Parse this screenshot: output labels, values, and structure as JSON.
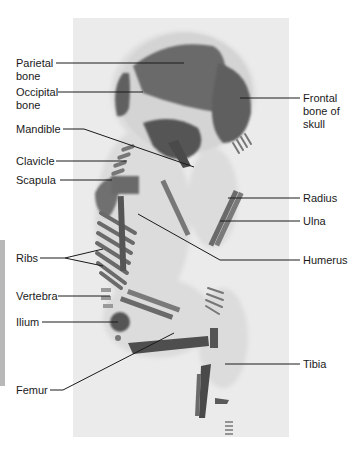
{
  "figure": {
    "labels_left": [
      {
        "id": "parietal",
        "text": "Parietal\nbone"
      },
      {
        "id": "occipital",
        "text": "Occipital\nbone"
      },
      {
        "id": "mandible",
        "text": "Mandible"
      },
      {
        "id": "clavicle",
        "text": "Clavicle"
      },
      {
        "id": "scapula",
        "text": "Scapula"
      },
      {
        "id": "ribs",
        "text": "Ribs"
      },
      {
        "id": "vertebra",
        "text": "Vertebra"
      },
      {
        "id": "ilium",
        "text": "Ilium"
      },
      {
        "id": "femur",
        "text": "Femur"
      }
    ],
    "labels_right": [
      {
        "id": "frontal",
        "text": "Frontal\nbone of\nskull"
      },
      {
        "id": "radius",
        "text": "Radius"
      },
      {
        "id": "ulna",
        "text": "Ulna"
      },
      {
        "id": "humerus",
        "text": "Humerus"
      },
      {
        "id": "tibia",
        "text": "Tibia"
      }
    ],
    "colors": {
      "photo_background": "#ebebeb",
      "body_halo": "#d9d9d9",
      "bone_dark": "#5a5a5a",
      "bone_mid": "#8a8a8a",
      "leader_line": "#1a1a1a",
      "edge_bar": "#b8b8b8"
    }
  }
}
